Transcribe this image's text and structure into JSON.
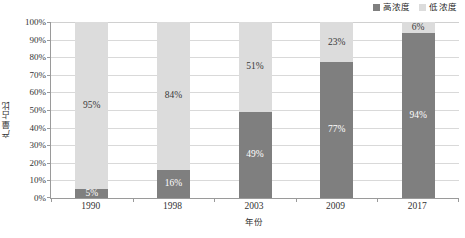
{
  "chart_data": {
    "type": "bar",
    "stacked": true,
    "stack_mode": "percent",
    "title": "",
    "xlabel": "年份",
    "ylabel": "产量占比",
    "categories": [
      "1990",
      "1998",
      "2003",
      "2009",
      "2017"
    ],
    "series": [
      {
        "name": "高浓度",
        "color": "#7f7f7f",
        "values": [
          5,
          16,
          49,
          77,
          94
        ],
        "value_labels": [
          "5%",
          "16%",
          "49%",
          "77%",
          "94%"
        ]
      },
      {
        "name": "低浓度",
        "color": "#dcdcdc",
        "values": [
          95,
          84,
          51,
          23,
          6
        ],
        "value_labels": [
          "95%",
          "84%",
          "51%",
          "23%",
          "6%"
        ]
      }
    ],
    "ylim": [
      0,
      100
    ],
    "y_tick_labels": [
      "100%",
      "90%",
      "80%",
      "70%",
      "60%",
      "50%",
      "40%",
      "30%",
      "20%",
      "10%",
      "0%"
    ],
    "y_tick_values": [
      100,
      90,
      80,
      70,
      60,
      50,
      40,
      30,
      20,
      10,
      0
    ],
    "grid": true,
    "grid_axis": "y",
    "legend_position": "top-right"
  },
  "legend": {
    "entries": [
      {
        "label": "高浓度",
        "color": "#7f7f7f"
      },
      {
        "label": "低浓度",
        "color": "#dcdcdc"
      }
    ]
  },
  "axes": {
    "y_title": "产量占比",
    "x_title": "年份"
  },
  "caption": {
    "text": ""
  },
  "colors": {
    "high_concentration": "#7f7f7f",
    "low_concentration": "#dcdcdc",
    "gridline": "#d9d9d9",
    "axis_line": "#9a9a9a",
    "plot_background": "#ffffff"
  }
}
